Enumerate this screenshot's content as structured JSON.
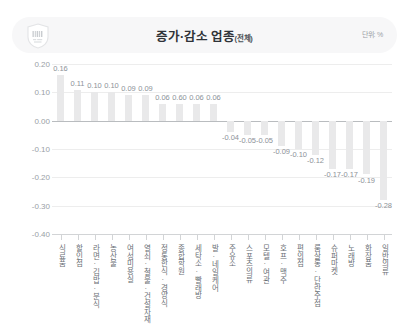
{
  "header": {
    "badge_icon": "barcode-badge-icon",
    "title": "증가·감소 업종",
    "title_suffix": "(전체)",
    "unit": "단위: %"
  },
  "chart_data": {
    "type": "bar",
    "title": "증가·감소 업종(전체)",
    "xlabel": "",
    "ylabel": "",
    "unit": "%",
    "ylim": [
      -0.4,
      0.2
    ],
    "yticks": [
      "0.20",
      "0.10",
      "0.00",
      "-0.10",
      "-0.20",
      "-0.30",
      "-0.40"
    ],
    "ytick_values": [
      0.2,
      0.1,
      0.0,
      -0.1,
      -0.2,
      -0.3,
      -0.4
    ],
    "grid": true,
    "legend": "none",
    "bar_color": "#e9e9ea",
    "categories": [
      "식료품",
      "할인점",
      "라면·김밥·분식",
      "농산물",
      "여성미용실",
      "열쇠·철물·건설자재",
      "정통한식·경양식",
      "종합학원",
      "세탁소·빨래방",
      "발·네일케어",
      "주유소",
      "스포츠의류",
      "모텔·여관",
      "호프·맥주",
      "편의점",
      "룸살롱·단란주점",
      "슈퍼마켓",
      "노래방",
      "화장품",
      "일반의류"
    ],
    "values": [
      0.16,
      0.11,
      0.1,
      0.1,
      0.09,
      0.09,
      0.06,
      0.06,
      0.06,
      0.06,
      -0.04,
      -0.05,
      -0.05,
      -0.09,
      -0.1,
      -0.12,
      -0.17,
      -0.17,
      -0.19,
      -0.28
    ],
    "value_labels": [
      "0.16",
      "0.11",
      "0.10",
      "0.10",
      "0.09",
      "0.09",
      "0.06",
      "0.60",
      "0.06",
      "0.06",
      "-0.04",
      "-0.05",
      "-0.05",
      "-0.09",
      "-0.10",
      "-0.12",
      "-0.17",
      "-0.17",
      "-0.19",
      "-0.28"
    ]
  }
}
